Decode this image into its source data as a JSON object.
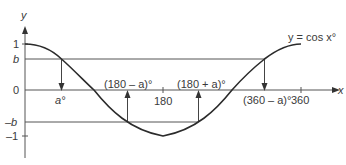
{
  "diagram": {
    "curve_label": "y = cos x°",
    "axes": {
      "x_label": "x",
      "y_label": "y",
      "origin_label": "0"
    },
    "y_ticks": {
      "one": "1",
      "b": "b",
      "neg_b": "–b",
      "neg_one": "–1"
    },
    "x_ticks": {
      "a": "a°",
      "one_eighty_minus_a": "(180 – a)°",
      "one_eighty": "180",
      "one_eighty_plus_a": "(180 + a)°",
      "three_sixty_minus_a": "(360 – a)°",
      "three_sixty": "360"
    },
    "colors": {
      "curve": "#2b2b2b",
      "lines": "#555555",
      "text": "#3a3a3a"
    },
    "parameters": {
      "b_value_approx": 0.67,
      "a_degrees_approx": 48
    }
  }
}
